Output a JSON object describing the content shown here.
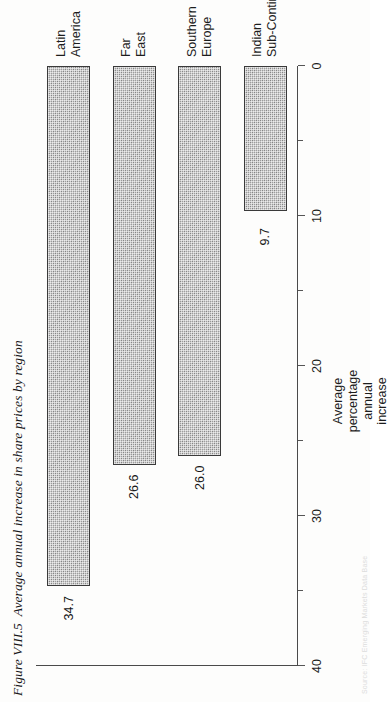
{
  "figure": {
    "number": "Figure VIII.5",
    "title": "Average annual increase in share prices by region",
    "source_note": "Source: IFC Emerging Markets Data Base"
  },
  "chart_data": {
    "type": "bar",
    "orientation": "horizontal",
    "title": "Average annual increase in share prices by region",
    "categories": [
      "Indian Sub-Continent",
      "Southern Europe",
      "Far East",
      "Latin America"
    ],
    "category_lines": [
      [
        "Indian",
        "Sub-Continent"
      ],
      [
        "Southern",
        "Europe"
      ],
      [
        "Far",
        "East"
      ],
      [
        "Latin",
        "America"
      ]
    ],
    "values": [
      9.7,
      26.0,
      26.6,
      34.7
    ],
    "value_labels": [
      "9.7",
      "26.0",
      "26.6",
      "34.7"
    ],
    "xlabel": "Average percentage annual increase",
    "xlabel_lines": [
      "Average",
      "percentage",
      "annual",
      "increase"
    ],
    "ylabel": "",
    "xlim": [
      0,
      40
    ],
    "major_ticks": [
      0,
      10,
      20,
      30,
      40
    ],
    "major_tick_labels": [
      "0",
      "10",
      "20",
      "30",
      "40"
    ],
    "minor_ticks": [
      5,
      15,
      25,
      35
    ],
    "grid": false,
    "legend": null,
    "bar_fill": "#9d9d9d",
    "bar_outline": "#3a3a3a",
    "axis_color": "#4a4a4a"
  }
}
